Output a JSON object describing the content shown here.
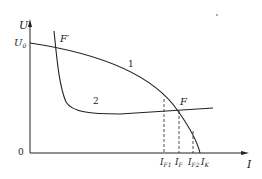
{
  "diagram": {
    "axes": {
      "y_label": "U",
      "x_label": "I",
      "origin_label": "0",
      "y_tick_label": "U",
      "y_tick_sub": "0"
    },
    "curves": [
      {
        "id": "1",
        "label": "1"
      },
      {
        "id": "2",
        "label": "2"
      }
    ],
    "points": {
      "F": "F",
      "F_prime": "F′"
    },
    "x_ticks": [
      {
        "main": "I",
        "sub": "F1"
      },
      {
        "main": "I",
        "sub": "F"
      },
      {
        "main": "I",
        "sub": "F2"
      },
      {
        "main": "I",
        "sub": "K"
      }
    ],
    "colors": {
      "line": "#222222",
      "background": "#ffffff"
    }
  }
}
